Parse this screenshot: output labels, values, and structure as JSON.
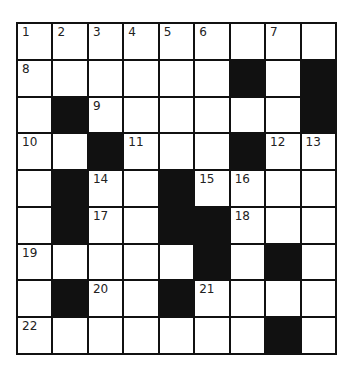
{
  "puzzle": {
    "rows": 9,
    "cols": 9,
    "colors": {
      "black": "#111111",
      "white": "#ffffff",
      "line": "#111111"
    },
    "grid": [
      [
        "1",
        "2",
        "3",
        "4",
        "5",
        "6",
        "",
        "7",
        ""
      ],
      [
        "8",
        "",
        "",
        "",
        "",
        "",
        "#",
        "",
        "#"
      ],
      [
        "",
        "#",
        "9",
        "",
        "",
        "",
        "",
        "",
        "#"
      ],
      [
        "10",
        "",
        "#",
        "11",
        "",
        "",
        "#",
        "12",
        "13"
      ],
      [
        "",
        "#",
        "14",
        "",
        "#",
        "15",
        "16",
        "",
        ""
      ],
      [
        "",
        "#",
        "17",
        "",
        "#",
        "#",
        "18",
        "",
        ""
      ],
      [
        "19",
        "",
        "",
        "",
        "",
        "#",
        "",
        "#",
        ""
      ],
      [
        "",
        "#",
        "20",
        "",
        "#",
        "21",
        "",
        "",
        ""
      ],
      [
        "22",
        "",
        "",
        "",
        "",
        "",
        "",
        "#",
        ""
      ]
    ]
  }
}
